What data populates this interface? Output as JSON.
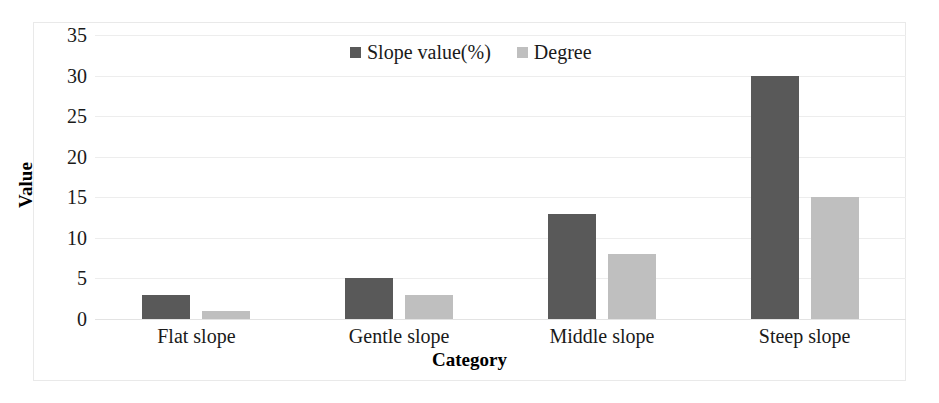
{
  "chart_data": {
    "type": "bar",
    "title": "",
    "xlabel": "Category",
    "ylabel": "Value",
    "categories": [
      "Flat slope",
      "Gentle slope",
      "Middle slope",
      "Steep slope"
    ],
    "series": [
      {
        "name": "Slope value(%)",
        "color": "#595959",
        "values": [
          3,
          5,
          13,
          30
        ]
      },
      {
        "name": "Degree",
        "color": "#bfbfbf",
        "values": [
          1,
          3,
          8,
          15
        ]
      }
    ],
    "ylim": [
      0,
      35
    ],
    "yticks": [
      0,
      5,
      10,
      15,
      20,
      25,
      30,
      35
    ],
    "ytick_labels": [
      "0",
      "5",
      "10",
      "15",
      "20",
      "25",
      "30",
      "35"
    ],
    "grid": true,
    "grid_axis": "y",
    "legend_position": "top-center"
  },
  "legend": {
    "items": [
      {
        "label": "Slope value(%)"
      },
      {
        "label": "Degree"
      }
    ]
  }
}
